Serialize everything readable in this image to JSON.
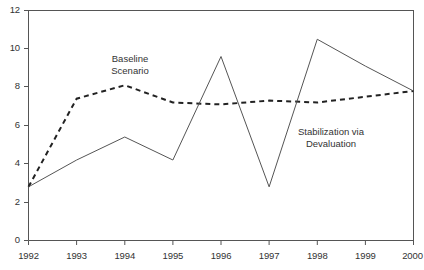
{
  "chart_data": {
    "type": "line",
    "title": "",
    "subtitle": "",
    "xlabel": "",
    "ylabel": "",
    "categories": [
      "1992",
      "1993",
      "1994",
      "1995",
      "1996",
      "1997",
      "1998",
      "1999",
      "2000"
    ],
    "x": [
      1992,
      1993,
      1994,
      1995,
      1996,
      1997,
      1998,
      1999,
      2000
    ],
    "xlim": [
      1992,
      2000
    ],
    "ylim": [
      0,
      12
    ],
    "yticks": [
      0,
      2,
      4,
      6,
      8,
      10,
      12
    ],
    "xticks": [
      1992,
      1993,
      1994,
      1995,
      1996,
      1997,
      1998,
      1999,
      2000
    ],
    "grid": false,
    "legend": "inline-annotations",
    "series": [
      {
        "name": "Baseline Scenario",
        "style": "dashed",
        "color": "#222222",
        "values": [
          2.8,
          7.4,
          8.1,
          7.2,
          7.1,
          7.3,
          7.2,
          7.5,
          7.8
        ]
      },
      {
        "name": "Stabilization via Devaluation",
        "style": "solid",
        "color": "#555555",
        "values": [
          2.8,
          4.2,
          5.4,
          4.2,
          9.6,
          2.8,
          10.5,
          9.1,
          7.8
        ]
      }
    ],
    "annotations": [
      {
        "name": "baseline-scenario-label",
        "lines": [
          "Baseline",
          "Scenario"
        ],
        "x": 130,
        "y": 58
      },
      {
        "name": "stabilization-label",
        "lines": [
          "Stabilization via",
          "Devaluation"
        ],
        "x": 330,
        "y": 131
      }
    ]
  },
  "axis": {
    "y_tick_labels": [
      "12",
      "10",
      "8",
      "6",
      "4",
      "2",
      "0"
    ],
    "x_tick_labels": [
      "1992",
      "1993",
      "1994",
      "1995",
      "1996",
      "1997",
      "1998",
      "1999",
      "2000"
    ]
  },
  "annotations": {
    "baseline": {
      "line1": "Baseline",
      "line2": "Scenario"
    },
    "stabilization": {
      "line1": "Stabilization via",
      "line2": "Devaluation"
    }
  },
  "colors": {
    "axis": "#555555",
    "baseline_series": "#222222",
    "stabilization_series": "#555555",
    "text": "#333333",
    "background": "#ffffff"
  }
}
